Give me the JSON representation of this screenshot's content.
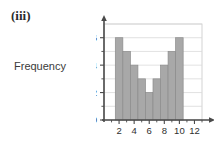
{
  "figure": {
    "part_label": "(iii)",
    "axis_title_y": "Frequency"
  },
  "colors": {
    "bar_fill": "#a8a8a8",
    "bar_edge": "#8c8c8c",
    "axis": "#4a4a4a",
    "grid": "#d9d9d9",
    "plot_border": "#c9c9c9",
    "background": "#ffffff",
    "text": "#2f2f2f"
  },
  "chart_data": {
    "type": "bar",
    "title": "",
    "subtitle": "",
    "xlabel": "",
    "ylabel": "Frequency",
    "categories": [
      2,
      3,
      4,
      5,
      6,
      7,
      8,
      9,
      10
    ],
    "values": [
      6,
      5,
      4,
      3,
      2,
      3,
      4,
      5,
      6
    ],
    "series": [
      {
        "name": "Frequency",
        "values": [
          6,
          5,
          4,
          3,
          2,
          3,
          4,
          5,
          6
        ]
      }
    ],
    "bar_width": 1,
    "bar_left_edges": [
      1.5,
      2.5,
      3.5,
      4.5,
      5.5,
      6.5,
      7.5,
      8.5,
      9.5
    ],
    "xlim": [
      0,
      13
    ],
    "ylim": [
      0,
      7
    ],
    "x_major_ticks": [
      2,
      4,
      6,
      8,
      10,
      12
    ],
    "x_minor_ticks": [
      1,
      3,
      5,
      7,
      9,
      11,
      13
    ],
    "x_tick_labels": [
      "2",
      "4",
      "6",
      "8",
      "10",
      "12"
    ],
    "y_major_ticks": [
      0,
      2,
      4,
      6
    ],
    "y_minor_ticks": [
      1,
      3,
      5
    ],
    "y_tick_labels": [
      "0",
      "2",
      "4",
      "6"
    ],
    "grid": true,
    "grid_axis": "y",
    "legend": false,
    "legend_position": "none",
    "axis_arrows": [
      "x-right",
      "y-up"
    ],
    "annotations": [
      "(iii)"
    ],
    "shape_description": "symmetric U-shaped (bimodal) distribution"
  }
}
